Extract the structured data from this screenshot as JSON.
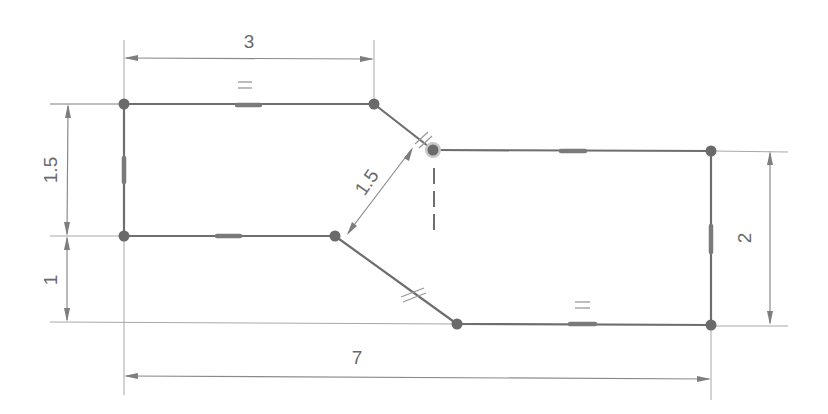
{
  "diagram": {
    "type": "constrained-sketch",
    "colors": {
      "background": "#ffffff",
      "geometry": "#6e6e6e",
      "dimension": "#8a8a8a",
      "text": "#6a6a6a"
    },
    "dimensions": {
      "top_width": "3",
      "left_upper_height": "1.5",
      "left_lower_height": "1",
      "slant_distance": "1.5",
      "right_height": "2",
      "overall_width": "7"
    },
    "vertices": [
      {
        "id": "P1",
        "x": 124,
        "y": 104
      },
      {
        "id": "P2",
        "x": 374,
        "y": 104
      },
      {
        "id": "P3",
        "x": 433,
        "y": 150
      },
      {
        "id": "P4",
        "x": 711,
        "y": 150
      },
      {
        "id": "P5",
        "x": 711,
        "y": 325
      },
      {
        "id": "P6",
        "x": 457,
        "y": 325
      },
      {
        "id": "P7",
        "x": 335,
        "y": 236
      },
      {
        "id": "P8",
        "x": 124,
        "y": 236
      }
    ],
    "constraints": {
      "equal_symbol": "=",
      "parallel_symbol": "//"
    }
  }
}
